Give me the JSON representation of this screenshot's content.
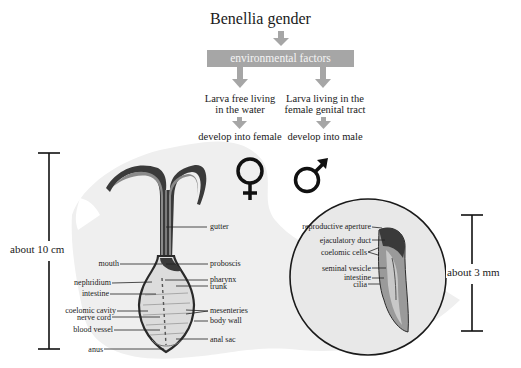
{
  "title": "Benellia gender",
  "flow": {
    "box_label": "environmental factors",
    "branches": [
      {
        "condition_line1": "Larva free living",
        "condition_line2": "in the water",
        "outcome": "develop into female",
        "symbol": "female-symbol"
      },
      {
        "condition_line1": "Larva living in the",
        "condition_line2": "female genital tract",
        "outcome": "develop into male",
        "symbol": "male-symbol"
      }
    ]
  },
  "female": {
    "scale_label": "about 10 cm",
    "labels_left": [
      "mouth",
      "nephridium",
      "intestine",
      "coelomic cavity",
      "nerve cord",
      "blood vessel",
      "anus"
    ],
    "labels_right": [
      "gutter",
      "proboscis",
      "pharynx",
      "trunk",
      "mesenteries",
      "body wall",
      "anal sac"
    ]
  },
  "male": {
    "scale_label": "about 3 mm",
    "labels": [
      "reproductive aperture",
      "ejaculatory duct",
      "coelomic cells",
      "seminal vesicle",
      "intestine",
      "cilia"
    ]
  },
  "colors": {
    "arrow_gray": "#a6a6a6",
    "background_blob": "#efefef",
    "body_dark": "#3a3a3a",
    "body_mid": "#8a8a8a"
  }
}
